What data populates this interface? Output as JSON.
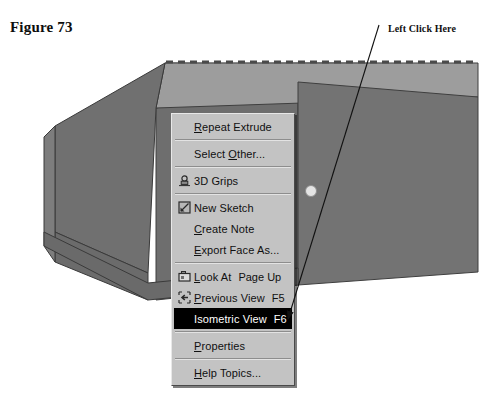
{
  "figure": {
    "caption": "Figure 73"
  },
  "annotation": {
    "label": "Left Click Here"
  },
  "colors": {
    "menu_face": "#c3c3c3",
    "menu_highlight_bg": "#000000",
    "menu_highlight_text": "#ffffff",
    "model_light_face": "#9a9a9a",
    "model_mid_face": "#8a8a8a",
    "model_dark_face": "#6f6f6f",
    "model_edge": "#3a3a3a",
    "handle_dot": "#e2e2e2"
  },
  "model": {
    "name": "extruded-house-solid",
    "handle_dot_label": "face-handle-dot",
    "ridge_highlight_label": "selected-edge-dashed"
  },
  "context_menu": {
    "name": "solid-edge-context-menu",
    "groups": [
      {
        "items": [
          {
            "label_pre": "",
            "accel": "R",
            "label_post": "epeat Extrude",
            "icon": "",
            "shortcut": ""
          }
        ]
      },
      {
        "items": [
          {
            "label_pre": "Select ",
            "accel": "O",
            "label_post": "ther...",
            "icon": "",
            "shortcut": ""
          }
        ]
      },
      {
        "items": [
          {
            "label_pre": "3D Grips",
            "accel": "",
            "label_post": "",
            "icon": "3d-grips-icon",
            "shortcut": ""
          }
        ]
      },
      {
        "items": [
          {
            "label_pre": "New Sketch",
            "accel": "",
            "label_post": "",
            "icon": "new-sketch-icon",
            "shortcut": ""
          },
          {
            "label_pre": "",
            "accel": "C",
            "label_post": "reate Note",
            "icon": "",
            "shortcut": ""
          },
          {
            "label_pre": "",
            "accel": "E",
            "label_post": "xport Face As...",
            "icon": "",
            "shortcut": ""
          }
        ]
      },
      {
        "items": [
          {
            "label_pre": "",
            "accel": "L",
            "label_post": "ook At",
            "icon": "look-at-icon",
            "shortcut": "Page Up"
          },
          {
            "label_pre": "",
            "accel": "P",
            "label_post": "revious View",
            "icon": "previous-view-icon",
            "shortcut": "F5"
          },
          {
            "label_pre": "Isometric View",
            "accel": "",
            "label_post": "",
            "icon": "",
            "shortcut": "F6",
            "highlighted": true
          }
        ]
      },
      {
        "items": [
          {
            "label_pre": "",
            "accel": "P",
            "label_post": "roperties",
            "icon": "",
            "shortcut": ""
          }
        ]
      },
      {
        "items": [
          {
            "label_pre": "",
            "accel": "H",
            "label_post": "elp Topics...",
            "icon": "",
            "shortcut": ""
          }
        ]
      }
    ]
  }
}
